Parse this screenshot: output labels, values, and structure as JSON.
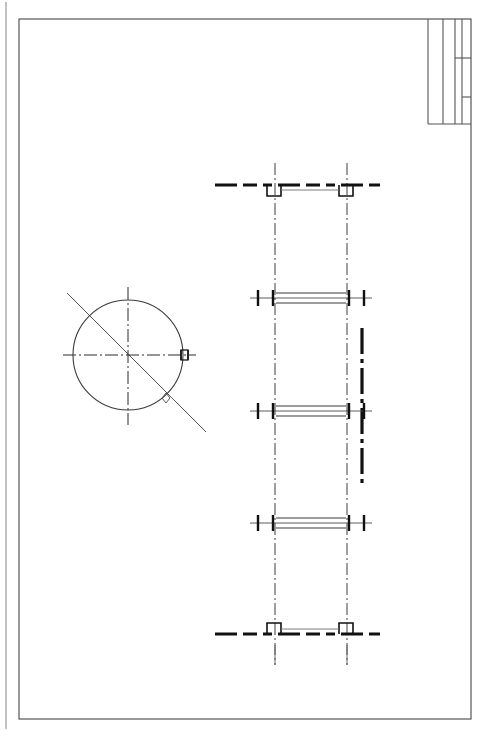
{
  "document": {
    "type": "mechanical-engineering-drawing",
    "sheet_width": 481,
    "sheet_height": 731,
    "background_color": "#ffffff",
    "line_color": "#1a1a1a",
    "frame_color": "#555555",
    "centerline_color": "#3c3c3c",
    "clipped_header_text": "· · ·  ·"
  },
  "page_edge": {
    "label": "page-edge-line",
    "x": 6,
    "y1": 2,
    "y2": 729,
    "color": "#8f8f8f"
  },
  "frame": {
    "label": "drawing-frame",
    "x": 19,
    "y": 19,
    "width": 452,
    "height": 700,
    "stroke": "#555555",
    "stroke_width": 1.2
  },
  "title_block": {
    "label": "title-block",
    "x": 428,
    "y": 19,
    "width": 43,
    "height": 105,
    "columns": [
      {
        "name": "column-1",
        "x": 428
      },
      {
        "name": "column-2",
        "x": 443
      },
      {
        "name": "column-3",
        "x": 455
      },
      {
        "name": "column-4",
        "x": 462
      },
      {
        "name": "column-5",
        "x": 471
      }
    ],
    "row_dividers": [
      {
        "name": "divider-upper",
        "y": 58,
        "x1": 455,
        "x2": 471
      },
      {
        "name": "divider-lower",
        "y": 97,
        "x1": 462,
        "x2": 471
      }
    ],
    "bottom_y": 124
  },
  "views": {
    "circular_view": {
      "label": "circular-end-view",
      "center_x": 128,
      "center_y": 355,
      "radius": 55,
      "stroke_width": 1,
      "horizontal_centerline": {
        "x1": 63,
        "x2": 196,
        "y": 355
      },
      "vertical_centerline": {
        "y1": 287,
        "y2": 425,
        "x": 128
      },
      "diagonal_line": {
        "x1": 67,
        "x2": 206,
        "y1": 293,
        "y2": 432
      },
      "diagonal_marker": {
        "x": 166,
        "y": 398,
        "size": 5,
        "shape": "diamond"
      },
      "keyway_feature": {
        "label": "keyway-notch",
        "x": 181,
        "y": 350,
        "width": 7,
        "height": 10
      }
    },
    "section_view": {
      "label": "longitudinal-section-view",
      "left_centerline_x": 275,
      "right_centerline_x": 347,
      "centerline_top_y": 163,
      "centerline_bottom_y": 665,
      "cutting_plane_line": {
        "label": "cutting-plane-line",
        "x": 362,
        "y1": 328,
        "y2": 483,
        "stroke_width": 3.2,
        "pattern": "dash-dot"
      },
      "bars": [
        {
          "name": "flange-top",
          "kind": "end-plate",
          "y": 185,
          "x1": 215,
          "x2": 380,
          "thickness": 3,
          "pattern": "dash-dot-thick",
          "bracket_direction": "down",
          "brackets": [
            {
              "x": 267,
              "width": 14,
              "height": 11
            },
            {
              "x": 339,
              "width": 14,
              "height": 11
            }
          ]
        },
        {
          "name": "shaft-section-1",
          "kind": "shaft-section",
          "y": 298,
          "x1": 250,
          "x2": 372,
          "tube_x1": 276,
          "tube_x2": 346,
          "tube_half_height": 5,
          "ticks": [
            258,
            273,
            349,
            364
          ]
        },
        {
          "name": "shaft-section-2",
          "kind": "shaft-section",
          "y": 411,
          "x1": 250,
          "x2": 372,
          "tube_x1": 276,
          "tube_x2": 346,
          "tube_half_height": 5,
          "ticks": [
            258,
            273,
            349,
            364
          ]
        },
        {
          "name": "shaft-section-3",
          "kind": "shaft-section",
          "y": 523,
          "x1": 250,
          "x2": 372,
          "tube_x1": 276,
          "tube_x2": 346,
          "tube_half_height": 5,
          "ticks": [
            258,
            273,
            349,
            364
          ]
        },
        {
          "name": "flange-bottom",
          "kind": "end-plate",
          "y": 634,
          "x1": 215,
          "x2": 380,
          "thickness": 3,
          "pattern": "dash-dot-thick",
          "bracket_direction": "up",
          "brackets": [
            {
              "x": 267,
              "width": 14,
              "height": 11
            },
            {
              "x": 339,
              "width": 14,
              "height": 11
            }
          ]
        }
      ],
      "hidden_stub_marks": [
        {
          "name": "stub-left",
          "x": 275,
          "y1": 645,
          "y2": 665
        },
        {
          "name": "stub-right",
          "x": 347,
          "y1": 645,
          "y2": 665
        }
      ]
    }
  }
}
